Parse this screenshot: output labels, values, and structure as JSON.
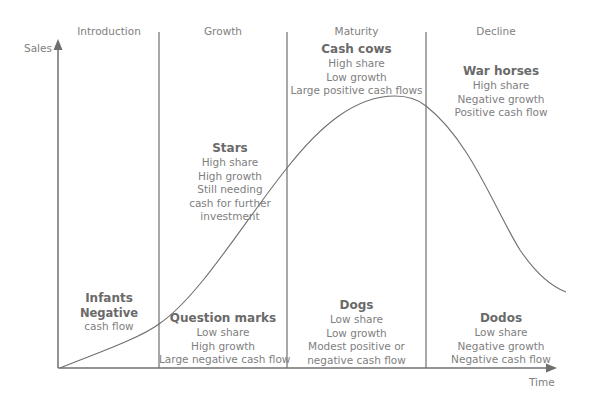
{
  "axes": {
    "y_label": "Sales",
    "x_label": "Time"
  },
  "stages": [
    {
      "label": "Introduction"
    },
    {
      "label": "Growth"
    },
    {
      "label": "Maturity"
    },
    {
      "label": "Decline"
    }
  ],
  "categories": {
    "cash_cows": {
      "title": "Cash cows",
      "lines": [
        "High share",
        "Low growth",
        "Large positive cash flows"
      ]
    },
    "war_horses": {
      "title": "War horses",
      "lines": [
        "High share",
        "Negative growth",
        "Positive cash flow"
      ]
    },
    "stars": {
      "title": "Stars",
      "lines": [
        "High share",
        "High growth",
        "Still needing",
        "cash for further",
        "investment"
      ]
    },
    "infants": {
      "title": "Infants",
      "bold_line": "Negative",
      "lines": [
        "cash flow"
      ]
    },
    "question_marks": {
      "title": "Question marks",
      "lines": [
        "Low share",
        "High growth",
        "Large negative cash flow"
      ]
    },
    "dogs": {
      "title": "Dogs",
      "lines": [
        "Low share",
        "Low growth",
        "Modest positive or",
        "negative cash flow"
      ]
    },
    "dodos": {
      "title": "Dodos",
      "lines": [
        "Low share",
        "Negative growth",
        "Negative cash flow"
      ]
    }
  },
  "colors": {
    "line": "#6f6f6f",
    "text": "#808080",
    "title_text": "#6a6a6a",
    "background": "#ffffff"
  }
}
